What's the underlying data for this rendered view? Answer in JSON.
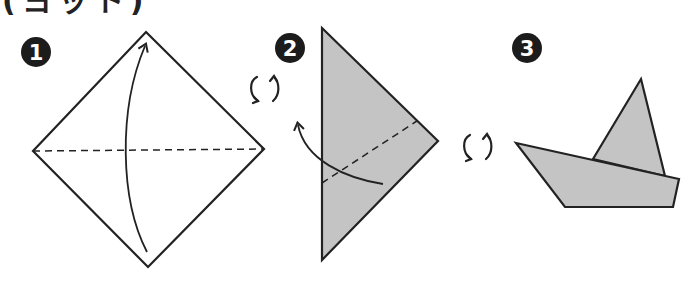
{
  "title": "(ヨット)",
  "colors": {
    "paper_back": "#ffffff",
    "paper_front": "#c4c4c4",
    "line": "#222222"
  },
  "steps": [
    {
      "number": "1",
      "description": "diamond square with horizontal valley fold line, arrow folding bottom corner up to top"
    },
    {
      "number": "2",
      "description": "grey triangle with diagonal dashed fold line, arrow folding lower flap up-left"
    },
    {
      "number": "3",
      "description": "finished sailboat with grey hull and sail"
    }
  ],
  "icons": {
    "flip_1": "flip-over-icon",
    "flip_2": "flip-over-icon"
  }
}
